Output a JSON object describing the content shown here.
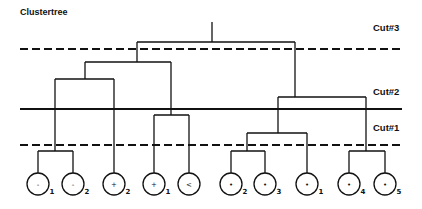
{
  "title": "Clustertree",
  "cuts": [
    {
      "label": "Cut#3",
      "y": 49,
      "style": "dashed",
      "label_y": 31
    },
    {
      "label": "Cut#2",
      "y": 109,
      "style": "solid",
      "label_y": 95
    },
    {
      "label": "Cut#1",
      "y": 145,
      "style": "dashed",
      "label_y": 131
    }
  ],
  "leaves": [
    {
      "x": 38,
      "symbol": "-",
      "sub": "1"
    },
    {
      "x": 73,
      "symbol": "-",
      "sub": "2"
    },
    {
      "x": 114,
      "symbol": "+",
      "sub": "2"
    },
    {
      "x": 154,
      "symbol": "+",
      "sub": "1"
    },
    {
      "x": 189,
      "symbol": "<",
      "sub": ""
    },
    {
      "x": 231,
      "symbol": "•",
      "sub": "2"
    },
    {
      "x": 265,
      "symbol": "•",
      "sub": "3"
    },
    {
      "x": 307,
      "symbol": "•",
      "sub": "1"
    },
    {
      "x": 349,
      "symbol": "•",
      "sub": "4"
    },
    {
      "x": 385,
      "symbol": "•",
      "sub": "5"
    }
  ],
  "links": [
    {
      "x1": 212,
      "x2": 212,
      "y1": 22,
      "y2": 42
    },
    {
      "x1": 137,
      "x2": 295,
      "y1": 42,
      "y2": 42
    },
    {
      "x1": 137,
      "x2": 137,
      "y1": 42,
      "y2": 62
    },
    {
      "x1": 85,
      "x2": 171,
      "y1": 62,
      "y2": 62
    },
    {
      "x1": 85,
      "x2": 85,
      "y1": 62,
      "y2": 79
    },
    {
      "x1": 55,
      "x2": 114,
      "y1": 79,
      "y2": 79
    },
    {
      "x1": 55,
      "x2": 55,
      "y1": 79,
      "y2": 151
    },
    {
      "x1": 38,
      "x2": 73,
      "y1": 151,
      "y2": 151
    },
    {
      "x1": 38,
      "x2": 38,
      "y1": 151,
      "y2": 173
    },
    {
      "x1": 73,
      "x2": 73,
      "y1": 151,
      "y2": 173
    },
    {
      "x1": 114,
      "x2": 114,
      "y1": 79,
      "y2": 173
    },
    {
      "x1": 171,
      "x2": 171,
      "y1": 62,
      "y2": 115
    },
    {
      "x1": 154,
      "x2": 189,
      "y1": 115,
      "y2": 115
    },
    {
      "x1": 154,
      "x2": 154,
      "y1": 115,
      "y2": 173
    },
    {
      "x1": 189,
      "x2": 189,
      "y1": 115,
      "y2": 173
    },
    {
      "x1": 295,
      "x2": 295,
      "y1": 42,
      "y2": 97
    },
    {
      "x1": 278,
      "x2": 366,
      "y1": 97,
      "y2": 97
    },
    {
      "x1": 278,
      "x2": 278,
      "y1": 97,
      "y2": 133
    },
    {
      "x1": 247,
      "x2": 307,
      "y1": 133,
      "y2": 133
    },
    {
      "x1": 247,
      "x2": 247,
      "y1": 133,
      "y2": 151
    },
    {
      "x1": 231,
      "x2": 265,
      "y1": 151,
      "y2": 151
    },
    {
      "x1": 231,
      "x2": 231,
      "y1": 151,
      "y2": 173
    },
    {
      "x1": 265,
      "x2": 265,
      "y1": 151,
      "y2": 173
    },
    {
      "x1": 307,
      "x2": 307,
      "y1": 133,
      "y2": 173
    },
    {
      "x1": 366,
      "x2": 366,
      "y1": 97,
      "y2": 151
    },
    {
      "x1": 349,
      "x2": 385,
      "y1": 151,
      "y2": 151
    },
    {
      "x1": 349,
      "x2": 349,
      "y1": 151,
      "y2": 173
    },
    {
      "x1": 385,
      "x2": 385,
      "y1": 151,
      "y2": 173
    }
  ],
  "layout": {
    "line_x_start": 20,
    "line_x_end": 402,
    "label_x": 373,
    "leaf_cy": 184,
    "leaf_r": 11
  }
}
